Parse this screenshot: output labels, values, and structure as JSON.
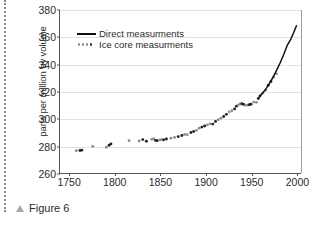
{
  "caption": {
    "marker": "triangle-up",
    "text": "Figure 6"
  },
  "chart_data": {
    "type": "scatter",
    "title": "",
    "xlabel": "",
    "ylabel": "parts per million by volume",
    "xlim": [
      1740,
      2005
    ],
    "ylim": [
      260,
      380
    ],
    "xticks": [
      1750,
      1800,
      1850,
      1900,
      1950,
      2000
    ],
    "yticks": [
      260,
      280,
      300,
      320,
      340,
      360,
      380
    ],
    "grid": "horizontal",
    "legend_position": "upper-left-inside",
    "legend": [
      {
        "label": "Direct measurments",
        "style": "solid-line",
        "color": "#111111"
      },
      {
        "label": "Ice core measurments",
        "style": "dotted-markers",
        "color": "#8e8e8e"
      }
    ],
    "series": [
      {
        "name": "Ice core measurments",
        "type": "scatter",
        "marker": "dot",
        "colors": [
          "#8e8e8e",
          "#222222"
        ],
        "points": [
          [
            1758,
            276.4
          ],
          [
            1762,
            276.6
          ],
          [
            1764,
            276.8
          ],
          [
            1776,
            279.6
          ],
          [
            1791,
            279.0
          ],
          [
            1794,
            280.4
          ],
          [
            1796,
            281.4
          ],
          [
            1816,
            283.8
          ],
          [
            1827,
            283.6
          ],
          [
            1831,
            284.6
          ],
          [
            1835,
            283.4
          ],
          [
            1841,
            284.8
          ],
          [
            1843,
            285.2
          ],
          [
            1845,
            284.0
          ],
          [
            1847,
            283.8
          ],
          [
            1850,
            284.4
          ],
          [
            1852,
            284.6
          ],
          [
            1854,
            284.4
          ],
          [
            1857,
            285.0
          ],
          [
            1862,
            285.6
          ],
          [
            1866,
            286.2
          ],
          [
            1870,
            286.8
          ],
          [
            1874,
            287.6
          ],
          [
            1877,
            288.4
          ],
          [
            1880,
            288.2
          ],
          [
            1884,
            289.8
          ],
          [
            1887,
            290.6
          ],
          [
            1890,
            291.4
          ],
          [
            1893,
            293.0
          ],
          [
            1896,
            293.8
          ],
          [
            1899,
            294.6
          ],
          [
            1902,
            295.4
          ],
          [
            1905,
            296.2
          ],
          [
            1908,
            296.0
          ],
          [
            1911,
            298.0
          ],
          [
            1914,
            299.2
          ],
          [
            1917,
            300.4
          ],
          [
            1920,
            301.6
          ],
          [
            1923,
            303.2
          ],
          [
            1926,
            305.0
          ],
          [
            1929,
            305.8
          ],
          [
            1932,
            307.2
          ],
          [
            1934,
            309.2
          ],
          [
            1936,
            310.0
          ],
          [
            1938,
            310.8
          ],
          [
            1940,
            311.0
          ],
          [
            1942,
            310.4
          ],
          [
            1944,
            309.8
          ],
          [
            1946,
            310.0
          ],
          [
            1948,
            310.2
          ],
          [
            1950,
            310.6
          ],
          [
            1953,
            312.2
          ],
          [
            1956,
            312.0
          ],
          [
            1958,
            314.8
          ],
          [
            1960,
            316.8
          ],
          [
            1963,
            318.8
          ],
          [
            1966,
            321.0
          ],
          [
            1969,
            324.6
          ],
          [
            1972,
            327.4
          ],
          [
            1975,
            330.6
          ],
          [
            1978,
            333.0
          ]
        ]
      },
      {
        "name": "Direct measurments",
        "type": "line",
        "color": "#111111",
        "points": [
          [
            1958,
            315.0
          ],
          [
            1962,
            318.4
          ],
          [
            1966,
            321.4
          ],
          [
            1970,
            325.6
          ],
          [
            1974,
            330.2
          ],
          [
            1978,
            335.4
          ],
          [
            1982,
            341.0
          ],
          [
            1986,
            347.2
          ],
          [
            1990,
            354.2
          ],
          [
            1994,
            358.8
          ],
          [
            1997,
            363.4
          ],
          [
            2000,
            368.4
          ]
        ]
      }
    ]
  }
}
